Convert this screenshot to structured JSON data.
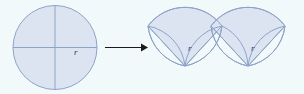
{
  "figure": {
    "background_color": "#f2f9fa",
    "shape_fill_color": "#dce4f2",
    "shape_stroke_color": "#8ea3c8",
    "label_color": "#2b3a6b",
    "arrow_color": "#1a1a1a"
  },
  "left_figure": {
    "name": "circle-with-radius",
    "shape": "circle",
    "center_x": 55,
    "center_y": 47,
    "radius": 42,
    "diameters": [
      "horizontal",
      "vertical"
    ],
    "radius_label": "r"
  },
  "arrow": {
    "name": "transformation-arrow",
    "glyph": "→",
    "x_start": 105,
    "x_end": 146,
    "y": 47
  },
  "right_figure": {
    "name": "rearranged-sectors",
    "shape": "sector-wave",
    "radius_labels": [
      "r",
      "r"
    ],
    "label_positions": [
      {
        "x": 191,
        "y": 48
      },
      {
        "x": 253,
        "y": 48
      }
    ],
    "bounds": {
      "x": 148,
      "y": 18,
      "width": 147,
      "height": 54
    }
  }
}
